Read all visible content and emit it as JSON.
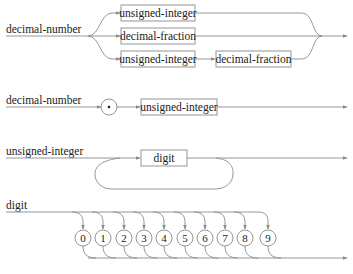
{
  "diagrams": [
    {
      "name": "decimal-number",
      "label": "decimal-number",
      "alternatives": [
        [
          "unsigned-integer"
        ],
        [
          "decimal-fraction"
        ],
        [
          "unsigned-integer",
          "decimal-fraction"
        ]
      ],
      "boxes": {
        "top": "unsigned-integer",
        "middle": "decimal-fraction",
        "bottom_first": "unsigned-integer",
        "bottom_second": "decimal-fraction"
      }
    },
    {
      "name": "decimal-fraction",
      "label": "decimal-number",
      "terminal": "•",
      "box": "unsigned-integer"
    },
    {
      "name": "unsigned-integer",
      "label": "unsigned-integer",
      "box": "digit",
      "loop": true
    },
    {
      "name": "digit",
      "label": "digit",
      "terminals": [
        "0",
        "1",
        "2",
        "3",
        "4",
        "5",
        "6",
        "7",
        "8",
        "9"
      ]
    }
  ],
  "colors": {
    "line": "#8a8a8a",
    "text": "#222222",
    "background": "#ffffff"
  }
}
